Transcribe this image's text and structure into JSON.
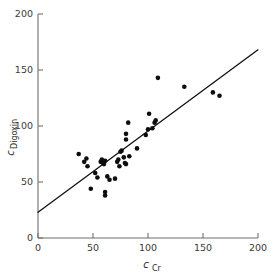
{
  "chart_data": {
    "type": "scatter",
    "title": "",
    "xlabel": "c_Cr",
    "xlabel_main": "c",
    "xlabel_sub": "Cr",
    "ylabel": "c_Digoxin",
    "ylabel_main": "c",
    "ylabel_sub": "Digoxin",
    "xlim": [
      0,
      200
    ],
    "ylim": [
      0,
      200
    ],
    "xticks": [
      0,
      50,
      100,
      150,
      200
    ],
    "yticks": [
      0,
      50,
      100,
      150,
      200
    ],
    "xtick_labels": [
      "0",
      "50",
      "100",
      "150",
      "200"
    ],
    "ytick_labels": [
      "0",
      "50",
      "100",
      "150",
      "200"
    ],
    "grid": false,
    "legend": false,
    "marker": "filled-circle",
    "marker_color": "#0d0d0d",
    "marker_size_px": 4.6,
    "line_color": "#111111",
    "axis_color": "#6f6f6f",
    "background_color": "#ffffff",
    "fit_line": {
      "label": "regression-line",
      "x": [
        0,
        200
      ],
      "y": [
        23,
        168
      ],
      "slope": 0.725,
      "intercept": 23
    },
    "points": [
      {
        "x": 37,
        "y": 75
      },
      {
        "x": 42,
        "y": 68
      },
      {
        "x": 44,
        "y": 71
      },
      {
        "x": 45,
        "y": 64
      },
      {
        "x": 48,
        "y": 44
      },
      {
        "x": 52,
        "y": 58
      },
      {
        "x": 54,
        "y": 54
      },
      {
        "x": 57,
        "y": 68
      },
      {
        "x": 58,
        "y": 70
      },
      {
        "x": 59,
        "y": 67
      },
      {
        "x": 60,
        "y": 66
      },
      {
        "x": 61,
        "y": 69
      },
      {
        "x": 61,
        "y": 41
      },
      {
        "x": 61,
        "y": 38
      },
      {
        "x": 63,
        "y": 55
      },
      {
        "x": 65,
        "y": 52
      },
      {
        "x": 70,
        "y": 53
      },
      {
        "x": 72,
        "y": 68
      },
      {
        "x": 73,
        "y": 70
      },
      {
        "x": 74,
        "y": 64
      },
      {
        "x": 75,
        "y": 77
      },
      {
        "x": 76,
        "y": 78
      },
      {
        "x": 78,
        "y": 72
      },
      {
        "x": 79,
        "y": 67
      },
      {
        "x": 80,
        "y": 66
      },
      {
        "x": 80,
        "y": 88
      },
      {
        "x": 80,
        "y": 93
      },
      {
        "x": 82,
        "y": 103
      },
      {
        "x": 83,
        "y": 73
      },
      {
        "x": 90,
        "y": 80
      },
      {
        "x": 98,
        "y": 92
      },
      {
        "x": 100,
        "y": 97
      },
      {
        "x": 101,
        "y": 111
      },
      {
        "x": 104,
        "y": 98
      },
      {
        "x": 106,
        "y": 103
      },
      {
        "x": 107,
        "y": 105
      },
      {
        "x": 109,
        "y": 143
      },
      {
        "x": 133,
        "y": 135
      },
      {
        "x": 159,
        "y": 130
      },
      {
        "x": 165,
        "y": 127
      }
    ]
  }
}
